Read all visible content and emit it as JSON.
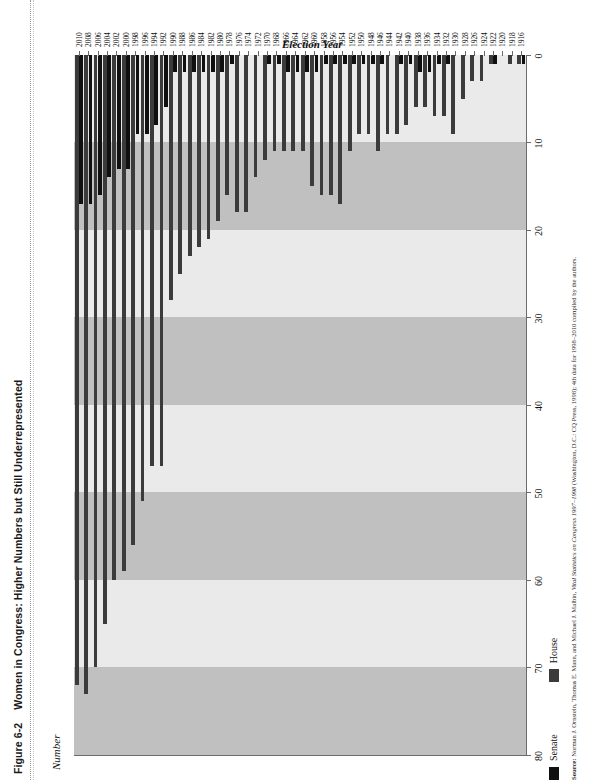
{
  "figure": {
    "number": "Figure 6-2",
    "title": "Women in Congress: Higher Numbers but Still Underrepresented"
  },
  "legend": {
    "position": "bottom",
    "items": [
      {
        "key": "senate",
        "label": "Senate",
        "color": "#101010"
      },
      {
        "key": "house",
        "label": "House",
        "color": "#3b3b3b"
      }
    ]
  },
  "source": {
    "prefix": "Source:",
    "authors": "Norman J. Ornstein, Thomas E. Mann, and Michael J. Malbin,",
    "work": "Vital Statistics on Congress 1997–1998",
    "pub": "(Washington, D.C.: CQ Press, 1998); 4th data for 1998–2010 compiled by the authors."
  },
  "chart_data": {
    "type": "bar",
    "orientation": "horizontal",
    "title": "Women in Congress: Higher Numbers but Still Underrepresented",
    "xlabel": "Number",
    "ylabel": "Election Year",
    "xlim": [
      0,
      80
    ],
    "xticks": [
      80,
      70,
      60,
      50,
      40,
      30,
      20,
      10,
      0
    ],
    "x_axis_reversed": true,
    "grid": "alternating vertical bands every 10 units",
    "band_colors": [
      "#eaeaea",
      "#c0c0c0"
    ],
    "categories": [
      "2010",
      "2008",
      "2006",
      "2004",
      "2002",
      "2000",
      "1998",
      "1996",
      "1994",
      "1992",
      "1990",
      "1988",
      "1986",
      "1984",
      "1982",
      "1980",
      "1978",
      "1976",
      "1974",
      "1972",
      "1970",
      "1968",
      "1966",
      "1964",
      "1962",
      "1960",
      "1958",
      "1956",
      "1954",
      "1952",
      "1950",
      "1948",
      "1946",
      "1944",
      "1942",
      "1940",
      "1938",
      "1936",
      "1934",
      "1932",
      "1930",
      "1928",
      "1926",
      "1924",
      "1922",
      "1920",
      "1918",
      "1916"
    ],
    "series": [
      {
        "name": "House",
        "color": "#3b3b3b",
        "values": [
          72,
          73,
          70,
          65,
          60,
          59,
          56,
          51,
          47,
          47,
          28,
          25,
          23,
          22,
          21,
          19,
          16,
          18,
          18,
          14,
          12,
          11,
          11,
          11,
          11,
          15,
          16,
          16,
          17,
          11,
          9,
          9,
          11,
          9,
          9,
          8,
          6,
          6,
          7,
          7,
          9,
          5,
          3,
          3,
          1,
          0,
          1,
          1
        ]
      },
      {
        "name": "Senate",
        "color": "#101010",
        "values": [
          17,
          17,
          16,
          14,
          13,
          13,
          9,
          9,
          8,
          6,
          2,
          2,
          2,
          2,
          2,
          2,
          1,
          0,
          0,
          0,
          1,
          1,
          2,
          2,
          2,
          2,
          1,
          1,
          1,
          1,
          1,
          1,
          1,
          0,
          1,
          1,
          2,
          2,
          1,
          1,
          0,
          0,
          0,
          0,
          1,
          0,
          0,
          1
        ]
      }
    ]
  }
}
